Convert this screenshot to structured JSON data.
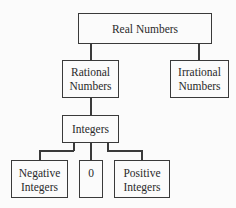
{
  "diagram": {
    "nodes": {
      "real": "Real Numbers",
      "rational_line1": "Rational",
      "rational_line2": "Numbers",
      "irrational_line1": "Irrational",
      "irrational_line2": "Numbers",
      "integers": "Integers",
      "negative_line1": "Negative",
      "negative_line2": "Integers",
      "zero": "0",
      "positive_line1": "Positive",
      "positive_line2": "Integers"
    },
    "edges": [
      [
        "Real Numbers",
        "Rational Numbers"
      ],
      [
        "Real Numbers",
        "Irrational Numbers"
      ],
      [
        "Rational Numbers",
        "Integers"
      ],
      [
        "Integers",
        "Negative Integers"
      ],
      [
        "Integers",
        "0"
      ],
      [
        "Integers",
        "Positive Integers"
      ]
    ]
  }
}
